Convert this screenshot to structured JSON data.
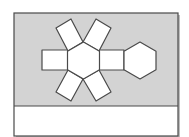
{
  "diagram": {
    "type": "net-of-hexagonal-prism",
    "colors": {
      "background": "#ffffff",
      "panel_fill": "#d3d3d3",
      "face_fill": "#ffffff",
      "stroke": "#4a4a4a",
      "answer_area_fill": "#ffffff"
    },
    "frame": {
      "x": 14,
      "y": 13,
      "width": 164,
      "height": 123,
      "divider_y": 106
    },
    "faces": {
      "hexagon_center": {
        "cx": 83.5,
        "cy": 60.5,
        "r": 18.5
      },
      "hexagon_right": {
        "cx": 140,
        "cy": 60.5,
        "r": 18.5
      },
      "rect_left": [
        [
          42,
          50
        ],
        [
          68,
          50
        ],
        [
          68,
          70
        ],
        [
          42,
          70
        ]
      ],
      "rect_right": [
        [
          99,
          50
        ],
        [
          124,
          50
        ],
        [
          124,
          70
        ],
        [
          99,
          70
        ]
      ],
      "rect_top_left": [
        [
          68,
          51
        ],
        [
          83,
          42
        ],
        [
          71,
          19
        ],
        [
          56,
          28
        ]
      ],
      "rect_top_right": [
        [
          83,
          42
        ],
        [
          99,
          51
        ],
        [
          111,
          28
        ],
        [
          96,
          19
        ]
      ],
      "rect_bottom_left": [
        [
          68,
          70
        ],
        [
          83,
          79
        ],
        [
          71,
          101
        ],
        [
          56,
          92
        ]
      ],
      "rect_bottom_right": [
        [
          83,
          79
        ],
        [
          99,
          70
        ],
        [
          111,
          92
        ],
        [
          96,
          101
        ]
      ]
    },
    "answer_area_text": ""
  }
}
